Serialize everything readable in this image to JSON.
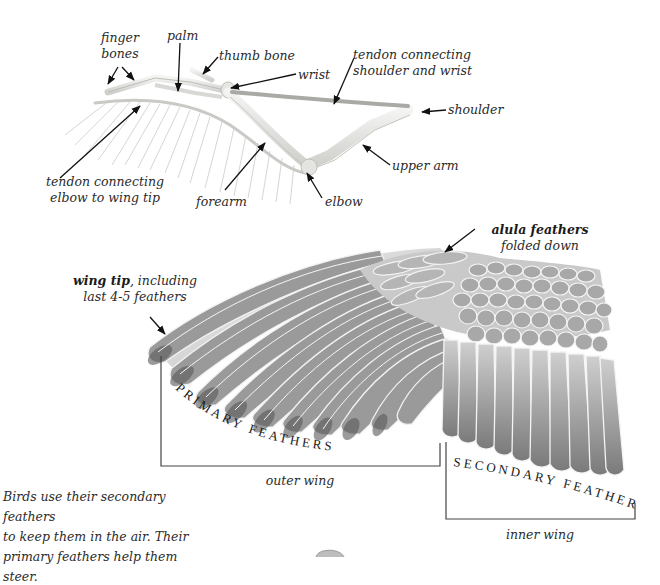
{
  "skeleton": {
    "labels": {
      "finger_bones_line1": "finger",
      "finger_bones_line2": "bones",
      "palm": "palm",
      "thumb_bone": "thumb bone",
      "wrist": "wrist",
      "tendon_shoulder_wrist_line1": "tendon connecting",
      "tendon_shoulder_wrist_line2": "shoulder and wrist",
      "shoulder": "shoulder",
      "upper_arm": "upper arm",
      "elbow": "elbow",
      "forearm": "forearm",
      "tendon_elbow_tip_line1": "tendon connecting",
      "tendon_elbow_tip_line2": "elbow to wing tip"
    }
  },
  "wing": {
    "labels": {
      "alula_bold": "alula feathers",
      "alula_sub": "folded down",
      "wing_tip_bold": "wing tip",
      "wing_tip_rest": ", including",
      "wing_tip_line2": "last 4-5 feathers",
      "primary_feathers": "PRIMARY FEATHERS",
      "secondary_feathers": "SECONDARY FEATHERS",
      "outer_wing": "outer wing",
      "inner_wing": "inner wing"
    }
  },
  "caption": {
    "line1": "Birds use their secondary feathers",
    "line2": "to keep them in the air. Their",
    "line3": "primary feathers help them steer."
  }
}
